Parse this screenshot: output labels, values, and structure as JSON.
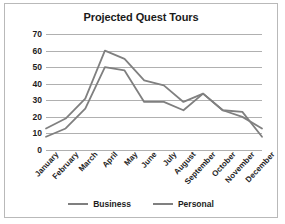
{
  "chart_data": {
    "type": "line",
    "title": "Projected Quest Tours",
    "xlabel": "",
    "ylabel": "",
    "ylim": [
      0,
      70
    ],
    "yticks": [
      0,
      10,
      20,
      30,
      40,
      50,
      60,
      70
    ],
    "grid": true,
    "legend_position": "bottom",
    "categories": [
      "January",
      "February",
      "March",
      "April",
      "May",
      "June",
      "July",
      "August",
      "September",
      "October",
      "November",
      "December"
    ],
    "series": [
      {
        "name": "Business",
        "color": "#7f7f7f",
        "values": [
          8,
          13,
          25,
          50,
          48,
          29,
          29,
          24,
          34,
          24,
          23,
          8
        ]
      },
      {
        "name": "Personal",
        "color": "#808080",
        "values": [
          13,
          19,
          31,
          60,
          55,
          42,
          39,
          29,
          34,
          24,
          20,
          13
        ]
      }
    ]
  },
  "legend": {
    "items": [
      {
        "label": "Business"
      },
      {
        "label": "Personal"
      }
    ]
  },
  "colors": {
    "border": "#b9b9b9",
    "gridline": "#b0b0b0",
    "text": "#1d1d1d",
    "background": "#ffffff"
  }
}
